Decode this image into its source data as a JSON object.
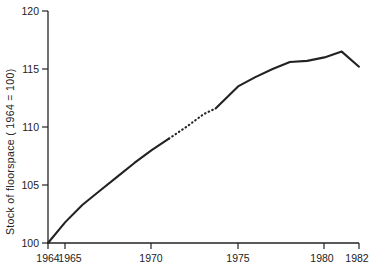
{
  "chart_data": {
    "type": "line",
    "title": "",
    "xlabel": "",
    "ylabel": "Stock of floorspace ( 1964 = 100)",
    "xlim": [
      1964,
      1982
    ],
    "ylim": [
      100,
      120
    ],
    "grid": false,
    "legend": null,
    "x_ticks": [
      1964,
      1965,
      1970,
      1975,
      1980,
      1982
    ],
    "x_tick_labels": [
      "1964",
      "1965",
      "1970",
      "1975",
      "1980",
      "1982"
    ],
    "y_ticks": [
      100,
      105,
      110,
      115,
      120
    ],
    "y_tick_labels": [
      "100",
      "105",
      "110",
      "115",
      "120"
    ],
    "series": [
      {
        "name": "Stock of floorspace",
        "style": "solid",
        "note": "observed",
        "x": [
          1964,
          1965,
          1966,
          1967,
          1968,
          1969,
          1970,
          1971
        ],
        "values": [
          100.0,
          101.8,
          103.3,
          104.5,
          105.7,
          106.9,
          108.0,
          109.0
        ]
      },
      {
        "name": "Stock of floorspace (interpolated)",
        "style": "dotted",
        "note": "estimated gap",
        "x": [
          1971,
          1972,
          1973,
          1973.7
        ],
        "values": [
          109.0,
          110.0,
          111.1,
          111.6
        ]
      },
      {
        "name": "Stock of floorspace (continued)",
        "style": "solid",
        "note": "observed",
        "x": [
          1973.7,
          1975,
          1976,
          1977,
          1978,
          1979,
          1980,
          1981,
          1982
        ],
        "values": [
          111.6,
          113.5,
          114.3,
          115.0,
          115.6,
          115.7,
          116.0,
          116.5,
          115.2
        ]
      }
    ],
    "annotations": []
  },
  "figure": {
    "background_color": "#ffffff",
    "line_color": "#222222",
    "axis_color": "#222222"
  }
}
